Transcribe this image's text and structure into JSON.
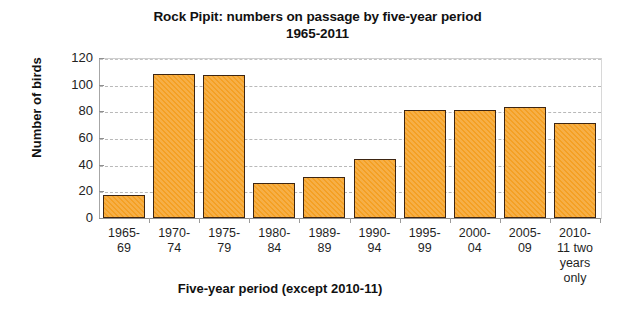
{
  "chart_data": {
    "type": "bar",
    "title": "Rock Pipit: numbers on passage by five-year period 1965-2011",
    "title_line1": "Rock Pipit: numbers on passage by five-year period",
    "title_line2": "1965-2011",
    "xlabel": "Five-year period (except 2010-11)",
    "ylabel": "Number of birds",
    "ylim": [
      0,
      120
    ],
    "ytick_values": [
      0,
      20,
      40,
      60,
      80,
      100,
      120
    ],
    "ytick_labels": [
      "0",
      "20",
      "40",
      "60",
      "80",
      "100",
      "120"
    ],
    "grid": true,
    "grid_axis": "y",
    "legend": false,
    "bar_color": "#f4a024",
    "bar_edge_color": "#3d2512",
    "categories": [
      "1965-69",
      "1970-74",
      "1975-79",
      "1980-84",
      "1989-89",
      "1990-94",
      "1995-99",
      "2000-04",
      "2005-09",
      "2010-11 two years only"
    ],
    "category_lines": [
      [
        "1965-",
        "69"
      ],
      [
        "1970-",
        "74"
      ],
      [
        "1975-",
        "79"
      ],
      [
        "1980-",
        "84"
      ],
      [
        "1989-",
        "89"
      ],
      [
        "1990-",
        "94"
      ],
      [
        "1995-",
        "99"
      ],
      [
        "2000-",
        "04"
      ],
      [
        "2005-",
        "09"
      ],
      [
        "2010-",
        "11 two",
        "years",
        "only"
      ]
    ],
    "values": [
      17,
      108,
      107,
      26,
      31,
      44,
      81,
      81,
      83,
      71
    ]
  }
}
